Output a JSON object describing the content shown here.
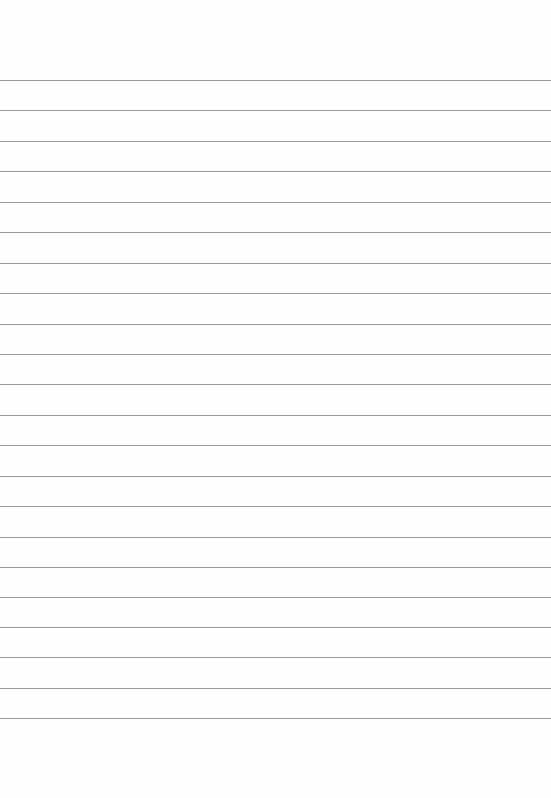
{
  "page": {
    "type": "ruled-paper",
    "line_color": "#9a9a9a",
    "background": "#fefefe",
    "rules_y": [
      80,
      110,
      141,
      171,
      202,
      232,
      263,
      293,
      324,
      354,
      384,
      415,
      445,
      476,
      506,
      537,
      567,
      597,
      627,
      657,
      688,
      718
    ]
  }
}
